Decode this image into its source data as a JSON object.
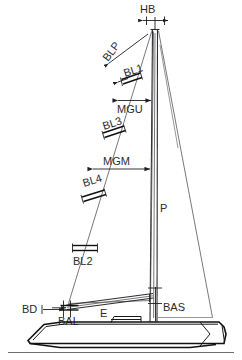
{
  "diagram": {
    "type": "sailboat-rig-measurement-diagram",
    "line_color": "#2e2e30",
    "hull_color": "#111111",
    "label_color": "#2b2b2b",
    "background": "#ffffff"
  },
  "labels": {
    "hb": "HB",
    "blp": "BLP",
    "bl1": "BL1",
    "mgu": "MGU",
    "bl3": "BL3",
    "mgm": "MGM",
    "bl4": "BL4",
    "bl2": "BL2",
    "p": "P",
    "bd": "BD",
    "bal": "BAL",
    "e": "E",
    "bas": "BAS"
  },
  "measurements": [
    {
      "code": "HB",
      "name": "Head Board width",
      "orientation": "horizontal",
      "location": "masthead"
    },
    {
      "code": "BLP",
      "name": "Base of Longest Perpendicular",
      "orientation": "rotated",
      "location": "jib-luff-upper"
    },
    {
      "code": "BL1",
      "name": "Batten Length 1",
      "orientation": "rotated",
      "location": "jib-upper"
    },
    {
      "code": "MGU",
      "name": "Mid Girth Upper",
      "orientation": "horizontal",
      "location": "jib-upper-girth"
    },
    {
      "code": "BL3",
      "name": "Batten Length 3",
      "orientation": "rotated",
      "location": "jib-mid-upper"
    },
    {
      "code": "MGM",
      "name": "Mid Girth Middle",
      "orientation": "horizontal",
      "location": "jib-mid-girth"
    },
    {
      "code": "BL4",
      "name": "Batten Length 4",
      "orientation": "rotated",
      "location": "jib-mid"
    },
    {
      "code": "BL2",
      "name": "Batten Length 2",
      "orientation": "horizontal",
      "location": "jib-lower"
    },
    {
      "code": "P",
      "name": "Mainsail luff length",
      "orientation": "horizontal",
      "location": "mainsail-center"
    },
    {
      "code": "BD",
      "name": "Bowsprit / Tack Distance",
      "orientation": "horizontal",
      "location": "bow-deck"
    },
    {
      "code": "BAL",
      "name": "Boom Above Line",
      "orientation": "horizontal",
      "location": "tack-area"
    },
    {
      "code": "E",
      "name": "Mainsail foot length",
      "orientation": "horizontal",
      "location": "boom"
    },
    {
      "code": "BAS",
      "name": "Boom Above Sheer",
      "orientation": "horizontal",
      "location": "mast-base"
    }
  ]
}
